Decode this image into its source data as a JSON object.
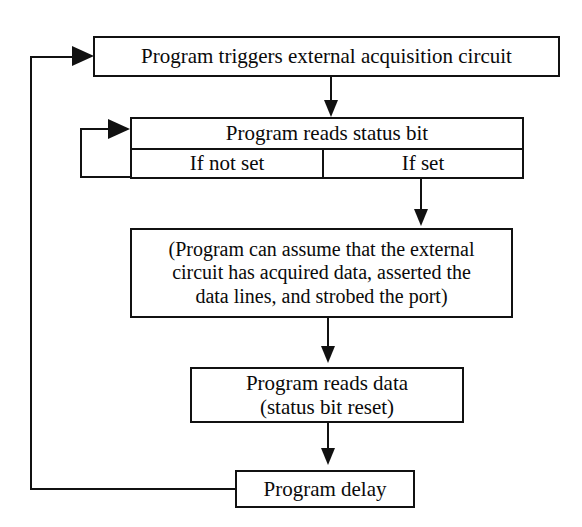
{
  "diagram": {
    "background_color": "#ffffff",
    "line_color": "#111111",
    "nodes": {
      "trigger": {
        "label": "Program triggers external acquisition circuit"
      },
      "status": {
        "head_label": "Program reads status bit",
        "branch_not_set_label": "If not set",
        "branch_set_label": "If set"
      },
      "assume": {
        "line1": "(Program can assume that the external",
        "line2": "circuit has acquired data, asserted the",
        "line3": "data lines, and strobed the port)"
      },
      "read_data": {
        "line1": "Program reads data",
        "line2": "(status bit reset)"
      },
      "delay": {
        "label": "Program delay"
      }
    },
    "connectors": {
      "trigger_to_status": "arrow-down",
      "set_to_assume": "arrow-down",
      "assume_to_read_data": "arrow-down",
      "read_data_to_delay": "arrow-down",
      "not_set_loop_back": "arrow-right",
      "delay_loop_to_trigger": "arrow-right"
    }
  }
}
